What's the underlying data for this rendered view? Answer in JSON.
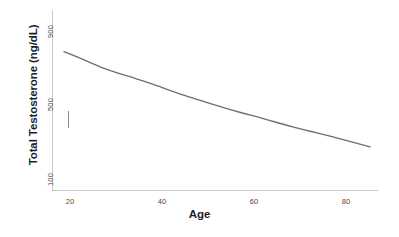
{
  "chart_data": {
    "type": "line",
    "title": "",
    "xlabel": "Age",
    "ylabel": "Total Testosterone (ng/dL)",
    "yscale": "log",
    "xlim": [
      18,
      87
    ],
    "ylim": [
      100,
      900
    ],
    "grid": false,
    "legend": null,
    "x_ticks": [
      "20",
      "40",
      "60",
      "80"
    ],
    "x_tick_values": [
      20,
      40,
      60,
      80
    ],
    "y_ticks": [
      "900",
      "500",
      "100"
    ],
    "y_tick_values": [
      900,
      500,
      100
    ],
    "series": [
      {
        "name": "Total Testosterone",
        "color": "#6e6e6e",
        "x": [
          18,
          22,
          26,
          30,
          34,
          38,
          42,
          46,
          50,
          54,
          58,
          62,
          66,
          70,
          74,
          78,
          82,
          87
        ],
        "values": [
          625,
          560,
          500,
          455,
          420,
          385,
          350,
          320,
          295,
          272,
          252,
          235,
          218,
          203,
          190,
          178,
          166,
          152
        ]
      }
    ],
    "annotations": [
      {
        "name": "error-bar",
        "type": "vertical-tick",
        "x": 19,
        "y_low": 200,
        "y_high": 258
      }
    ]
  },
  "axes": {
    "y_title": "Total Testosterone (ng/dL)",
    "x_title": "Age",
    "y_tick_900": "900",
    "y_tick_500": "500",
    "y_tick_100": "100",
    "x_tick_20": "20",
    "x_tick_40": "40",
    "x_tick_60": "60",
    "x_tick_80": "80"
  },
  "colors": {
    "curve": "#6e6e6e",
    "axis": "#c9c9c9",
    "text": "#1d1d1d",
    "tick_text": "#4a4a4a",
    "background": "#ffffff"
  }
}
